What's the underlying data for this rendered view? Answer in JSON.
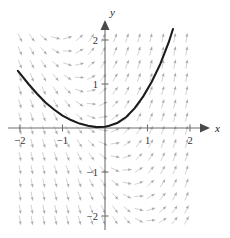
{
  "figure": {
    "title": "",
    "background_color": "#ffffff"
  },
  "axes": {
    "x_name": "x",
    "y_name": "y",
    "x_ticks": [
      {
        "value": -2,
        "label": "−2"
      },
      {
        "value": -1,
        "label": "−1"
      },
      {
        "value": 1,
        "label": "1"
      },
      {
        "value": 2,
        "label": "2"
      }
    ],
    "y_ticks": [
      {
        "value": 2,
        "label": "2"
      },
      {
        "value": 1,
        "label": "1"
      },
      {
        "value": -1,
        "label": "−1"
      },
      {
        "value": -2,
        "label": "−2"
      }
    ],
    "axis_color": "#6f6f6f",
    "label_color": "#333333"
  },
  "chart_data": {
    "type": "line",
    "title": "",
    "xlabel": "x",
    "ylabel": "y",
    "xlim": [
      -2.15,
      2.15
    ],
    "ylim": [
      -2.2,
      2.4
    ],
    "grid": false,
    "legend": "none",
    "direction_field": {
      "description": "slope field of arrow segments",
      "slope_formula": "2x + y",
      "color": "#c9c9cf",
      "x_samples": [
        -2.0,
        -1.72,
        -1.44,
        -1.16,
        -0.88,
        -0.6,
        -0.32,
        -0.04,
        0.24,
        0.52,
        0.8,
        1.08,
        1.36,
        1.64,
        1.92
      ],
      "y_samples": [
        2.05,
        1.75,
        1.45,
        1.15,
        0.85,
        0.55,
        0.25,
        -0.05,
        -0.35,
        -0.65,
        -0.95,
        -1.25,
        -1.55,
        -1.85,
        -2.1
      ]
    },
    "series": [
      {
        "name": "solution curve",
        "color": "#1b1b1b",
        "formula": "y = 2*x^2/2.6 approx parabola through minimum near origin",
        "x": [
          -2.05,
          -1.8,
          -1.6,
          -1.4,
          -1.2,
          -1.0,
          -0.8,
          -0.6,
          -0.4,
          -0.2,
          0.0,
          0.1,
          0.3,
          0.5,
          0.7,
          0.9,
          1.1,
          1.3,
          1.5,
          1.6
        ],
        "y": [
          1.3,
          1.0,
          0.78,
          0.58,
          0.42,
          0.28,
          0.18,
          0.1,
          0.05,
          0.02,
          0.03,
          0.05,
          0.12,
          0.25,
          0.45,
          0.72,
          1.05,
          1.45,
          1.95,
          2.25
        ]
      }
    ]
  }
}
